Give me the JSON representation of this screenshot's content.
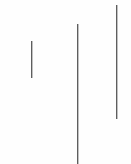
{
  "canvas": {
    "width": 131,
    "height": 164,
    "background_color": "#fefefe"
  },
  "chart_data": {
    "type": "bar",
    "title": "",
    "subtitle": "",
    "xlabel": "",
    "ylabel": "",
    "grid": false,
    "legend": null,
    "orientation": "vertical",
    "note": "Three thin vertical line marks of differing length and vertical offset on a plain white field; no axes, labels, ticks or legend are rendered.",
    "categories": [
      "mark-1",
      "mark-2",
      "mark-3"
    ],
    "values": [
      37,
      140,
      114
    ],
    "ylim": [
      0,
      164
    ],
    "marks": [
      {
        "name": "mark-1",
        "x": 31,
        "y_top": 41,
        "y_bottom": 78,
        "length": 37,
        "thickness": 1,
        "color": "#4a4a4a"
      },
      {
        "name": "mark-2",
        "x": 77,
        "y_top": 24,
        "y_bottom": 164,
        "length": 140,
        "thickness": 1,
        "color": "#4a4a4a"
      },
      {
        "name": "mark-3",
        "x": 116,
        "y_top": 5,
        "y_bottom": 119,
        "length": 114,
        "thickness": 1,
        "color": "#4a4a4a"
      }
    ]
  }
}
